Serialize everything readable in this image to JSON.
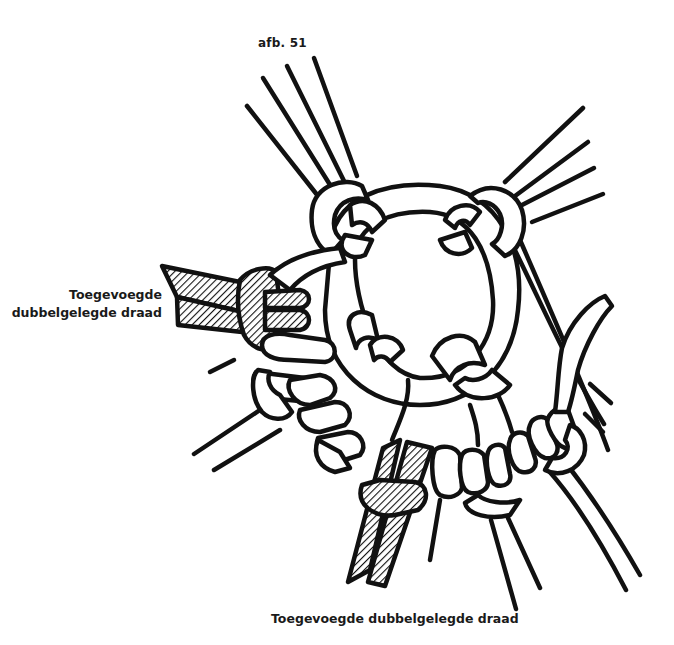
{
  "figure": {
    "title": "afb. 51",
    "label_left_line1": "Toegevoegde",
    "label_left_line2": "dubbelgelegde draad",
    "label_bottom": "Toegevoegde dubbelgelegde draad"
  },
  "illustration": {
    "subject": "macrame-ring-with-added-doubled-cords",
    "colors": {
      "ink": "#111111",
      "paper": "#ffffff"
    },
    "hatched_cords": [
      "left-added-doubled-cord",
      "bottom-added-doubled-cord"
    ]
  }
}
